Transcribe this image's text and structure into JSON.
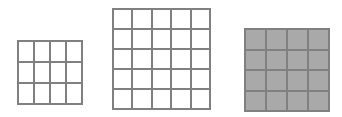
{
  "figure": {
    "background_color": "#ffffff",
    "line_color": "#808080",
    "line_width_px": 2,
    "width_px": 342,
    "height_px": 117
  },
  "chart_data": {
    "type": "table",
    "title": "",
    "subtitle": "",
    "xlabel": "",
    "ylabel": "",
    "categories": [
      "3x3 grid",
      "5x5 grid",
      "4x4 grid"
    ],
    "values": [
      9,
      25,
      16
    ],
    "grids": [
      {
        "name": "grid-3x3",
        "rows": 3,
        "columns": 4,
        "cell_count": 9,
        "fill": "white",
        "fill_color": "#ffffff",
        "border_color": "#808080",
        "position": {
          "x": 17,
          "y": 40,
          "width": 66,
          "height": 65
        }
      },
      {
        "name": "grid-5x5",
        "rows": 5,
        "columns": 5,
        "cell_count": 25,
        "fill": "white",
        "fill_color": "#ffffff",
        "border_color": "#808080",
        "position": {
          "x": 112,
          "y": 8,
          "width": 99,
          "height": 102
        }
      },
      {
        "name": "grid-4x4",
        "rows": 4,
        "columns": 4,
        "cell_count": 16,
        "fill": "gray",
        "fill_color": "#a9a9a9",
        "border_color": "#808080",
        "position": {
          "x": 244,
          "y": 28,
          "width": 86,
          "height": 84
        }
      }
    ],
    "grid": true,
    "legend": null
  }
}
